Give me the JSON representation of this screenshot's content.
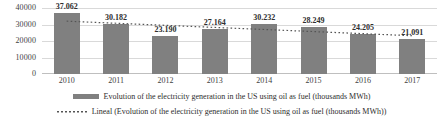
{
  "chart_data": {
    "type": "bar",
    "title": "",
    "xlabel": "",
    "ylabel": "",
    "categories": [
      "2010",
      "2011",
      "2012",
      "2013",
      "2014",
      "2015",
      "2016",
      "2017"
    ],
    "values": [
      37062,
      30182,
      23190,
      27164,
      30232,
      28249,
      24205,
      21091
    ],
    "value_labels": [
      "37.062",
      "30.182",
      "23.190",
      "27.164",
      "30.232",
      "28.249",
      "24.205",
      "21.091"
    ],
    "ylim": [
      0,
      40000
    ],
    "y_ticks": [
      40000,
      30000,
      20000,
      10000,
      0
    ],
    "y_tick_labels": [
      "40000",
      "30000",
      "20000",
      "10000",
      "0"
    ],
    "grid": true,
    "legend_position": "bottom",
    "series": [
      {
        "name": "Evolution of the electricity generation in the US using oil as fuel  (thousands MWh)",
        "type": "bar",
        "color": "#808080",
        "values": [
          37062,
          30182,
          23190,
          27164,
          30232,
          28249,
          24205,
          21091
        ]
      },
      {
        "name": "Lineal (Evolution of the electricity generation in the US using oil as fuel  (thousands MWh))",
        "type": "line-trend",
        "style": "dotted",
        "color": "#555555",
        "values": [
          32010,
          30750,
          29490,
          28230,
          26970,
          25710,
          24450,
          23190
        ]
      }
    ],
    "legend": [
      {
        "marker": "bar-swatch",
        "label": "Evolution of the electricity generation in the US using oil as fuel  (thousands MWh)"
      },
      {
        "marker": "dotted-line-swatch",
        "label": "Lineal (Evolution of the electricity generation in the US using oil as fuel  (thousands MWh))"
      }
    ]
  },
  "colors": {
    "bar": "#808080",
    "trendline": "#555555",
    "gridline": "#d9d9d9",
    "text": "#2e2e2e"
  }
}
